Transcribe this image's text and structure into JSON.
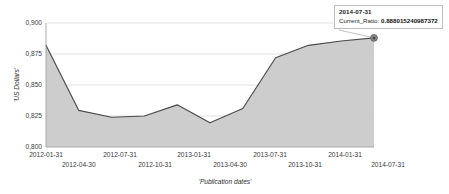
{
  "chart_data": {
    "type": "area",
    "title": "",
    "xlabel": "'Publication dates'",
    "ylabel": "'US Dollars'",
    "ylim": [
      0.8,
      0.9
    ],
    "yticks": [
      "0,800",
      "0,825",
      "0,850",
      "0,875",
      "0,900"
    ],
    "ytick_values": [
      0.8,
      0.825,
      0.85,
      0.875,
      0.9
    ],
    "grid": true,
    "legend": "none",
    "series_name": "Current_Ratio",
    "categories": [
      "2012-01-31",
      "2012-04-30",
      "2012-07-31",
      "2012-10-31",
      "2013-01-31",
      "2013-04-30",
      "2013-07-31",
      "2013-10-31",
      "2014-01-31",
      "2014-04-30",
      "2014-07-31"
    ],
    "values": [
      0.882,
      0.8295,
      0.824,
      0.825,
      0.834,
      0.8195,
      0.831,
      0.872,
      0.882,
      0.8855,
      0.888
    ],
    "xtick_labels": [
      "2012-01-31",
      "2012-04-30",
      "2012-07-31",
      "2012-10-31",
      "2013-01-31",
      "2013-04-30",
      "2013-07-31",
      "2013-10-31",
      "2014-01-31",
      "2014-07-31"
    ],
    "colors": {
      "area_fill": "#c9c9c9",
      "line": "#4a4a4a",
      "gridline": "#d6d6d6",
      "axis": "#9a9a9a",
      "text": "#3a3a3a"
    }
  },
  "tooltip": {
    "date": "2014-07-31",
    "metric_label": "Current_Ratio:",
    "metric_value": "0.888015240987372"
  }
}
